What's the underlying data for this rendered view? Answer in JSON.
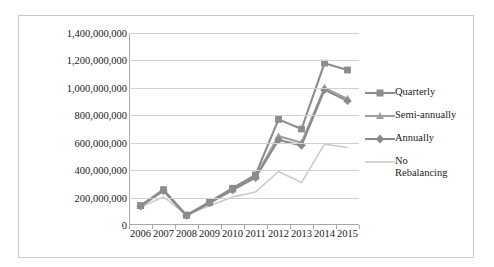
{
  "chart_data": {
    "type": "line",
    "title": "",
    "xlabel": "",
    "ylabel": "",
    "categories": [
      "2006",
      "2007",
      "2008",
      "2009",
      "2010",
      "2011",
      "2012",
      "2013",
      "2014",
      "2015"
    ],
    "ylim": [
      0,
      1400000000
    ],
    "ytick_step": 200000000,
    "ytick_labels": [
      "0",
      "200,000,000",
      "400,000,000",
      "600,000,000",
      "800,000,000",
      "1,000,000,000",
      "1,200,000,000",
      "1,400,000,000"
    ],
    "ytick_values": [
      0,
      200000000,
      400000000,
      600000000,
      800000000,
      1000000000,
      1200000000,
      1400000000
    ],
    "grid": true,
    "legend_position": "right",
    "series": [
      {
        "name": "Quarterly",
        "marker": "square",
        "color": "#8c8c8c",
        "values": [
          142000000,
          258000000,
          72000000,
          168000000,
          268000000,
          365000000,
          770000000,
          700000000,
          1180000000,
          1130000000
        ]
      },
      {
        "name": "Semi-annually",
        "marker": "triangle",
        "color": "#a0a0a0",
        "values": [
          138000000,
          252000000,
          70000000,
          162000000,
          258000000,
          352000000,
          648000000,
          600000000,
          1000000000,
          920000000
        ]
      },
      {
        "name": "Annually",
        "marker": "diamond",
        "color": "#8a8a8a",
        "values": [
          136000000,
          250000000,
          68000000,
          160000000,
          255000000,
          345000000,
          620000000,
          580000000,
          985000000,
          905000000
        ]
      },
      {
        "name": "No\nRebalancing",
        "marker": "none",
        "color": "#cccccc",
        "values": [
          130000000,
          205000000,
          75000000,
          140000000,
          205000000,
          240000000,
          390000000,
          310000000,
          590000000,
          565000000
        ]
      }
    ]
  },
  "legend": {
    "items": [
      {
        "label": "Quarterly"
      },
      {
        "label": "Semi-annually"
      },
      {
        "label": "Annually"
      },
      {
        "label": "No\nRebalancing"
      }
    ]
  }
}
